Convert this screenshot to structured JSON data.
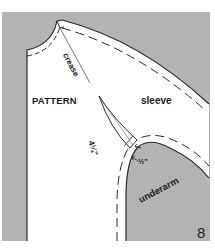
{
  "figure": {
    "number": "8",
    "labels": {
      "pattern": "PATTERN",
      "sleeve": "sleeve",
      "crease": "crease",
      "underarm": "underarm",
      "measure_long": "4¼\"",
      "measure_short": "½\""
    },
    "colors": {
      "background_grey": "#b3b3b3",
      "pattern_white": "#ffffff",
      "outline": "#2a2a2a",
      "dashed_line": "#2a2a2a"
    }
  }
}
